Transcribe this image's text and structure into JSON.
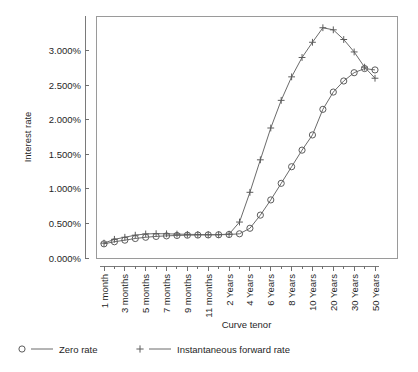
{
  "chart_data": {
    "type": "line",
    "title": "",
    "xlabel": "Curve tenor",
    "ylabel": "Interest rate",
    "ylim": [
      0.0,
      3.5
    ],
    "yticks": [
      0.0,
      0.5,
      1.0,
      1.5,
      2.0,
      2.5,
      3.0
    ],
    "ytick_labels": [
      "0.000%",
      "0.500%",
      "1.000%",
      "1.500%",
      "2.000%",
      "2.500%",
      "3.000%"
    ],
    "grid": false,
    "legend_position": "below",
    "x": [
      "1 month",
      "2 months",
      "3 months",
      "4 months",
      "5 months",
      "6 months",
      "7 months",
      "8 months",
      "9 months",
      "10 months",
      "11 months",
      "1 Year",
      "2 Years",
      "3 Years",
      "4 Years",
      "5 Years",
      "6 Years",
      "7 Years",
      "8 Years",
      "9 Years",
      "10 Years",
      "15 Years",
      "20 Years",
      "25 Years",
      "30 Years",
      "40 Years",
      "50 Years"
    ],
    "xtick_labels": [
      "1 month",
      "3 months",
      "5 months",
      "7 months",
      "9 months",
      "11 months",
      "2 Years",
      "4 Years",
      "6 Years",
      "8 Years",
      "10 Years",
      "20 Years",
      "30 Years",
      "50 Years"
    ],
    "series": [
      {
        "name": "Zero rate",
        "marker": "circle",
        "values": [
          0.205,
          0.235,
          0.258,
          0.282,
          0.3,
          0.312,
          0.32,
          0.326,
          0.33,
          0.332,
          0.334,
          0.336,
          0.34,
          0.35,
          0.43,
          0.62,
          0.84,
          1.08,
          1.32,
          1.56,
          1.78,
          2.15,
          2.4,
          2.56,
          2.68,
          2.74,
          2.72
        ]
      },
      {
        "name": "Instantaneous forward rate",
        "marker": "plus",
        "values": [
          0.215,
          0.27,
          0.3,
          0.33,
          0.348,
          0.352,
          0.35,
          0.346,
          0.342,
          0.34,
          0.338,
          0.338,
          0.345,
          0.52,
          0.95,
          1.42,
          1.88,
          2.28,
          2.62,
          2.9,
          3.12,
          3.33,
          3.3,
          3.16,
          2.98,
          2.76,
          2.6
        ]
      }
    ]
  },
  "legend": {
    "entries": [
      {
        "label": "Zero rate",
        "marker_icon": "circle-marker-icon"
      },
      {
        "label": "Instantaneous forward rate",
        "marker_icon": "plus-marker-icon"
      }
    ]
  }
}
